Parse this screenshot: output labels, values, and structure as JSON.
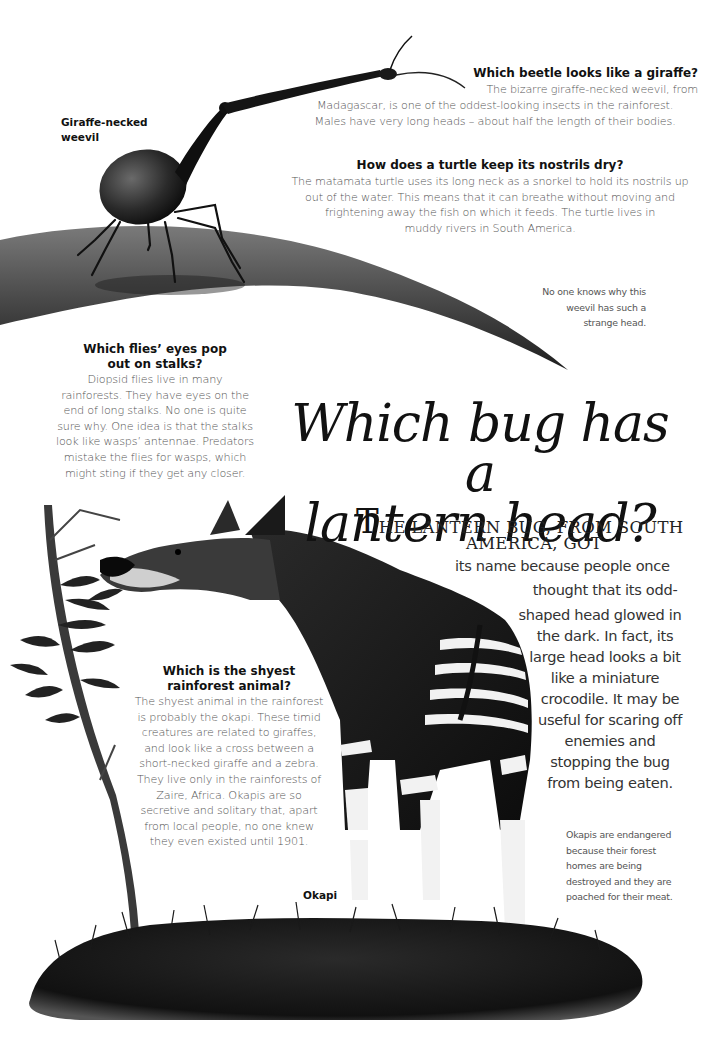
{
  "headline": {
    "line1": "Which bug has a",
    "line2": "lantern head?"
  },
  "lead": {
    "drop_cap": "T",
    "caps_line1": "HE LANTERN BUG, FROM SOUTH",
    "caps_line2": "AMERICA, GOT",
    "body_lines": [
      "its name because people once",
      "thought that its odd-",
      "shaped head glowed in",
      "the dark. In fact, its",
      "large head looks a bit",
      "like a miniature",
      "crocodile. It may be",
      "useful for scaring off",
      "enemies and",
      "stopping the bug",
      "from being eaten."
    ]
  },
  "sections": {
    "beetle": {
      "title": "Which beetle looks like a giraffe?",
      "lines": [
        "The bizarre giraffe-necked weevil, from",
        "Madagascar, is one of the oddest-looking insects in the rainforest.",
        "Males have very long heads – about half the length of their bodies."
      ]
    },
    "turtle": {
      "title": "How does a turtle keep its nostrils dry?",
      "lines": [
        "The matamata turtle uses its long neck as a snorkel to hold its nostrils up",
        "out of the water. This means that it can breathe without moving and",
        "frightening away the fish on which it feeds. The turtle lives in",
        "muddy rivers in South America."
      ]
    },
    "flies": {
      "title_lines": [
        "Which flies’ eyes pop",
        "out on stalks?"
      ],
      "lines": [
        "Diopsid flies live in many",
        "rainforests. They have eyes on the",
        "end of long stalks. No one is quite",
        "sure why. One idea is that the stalks",
        "look like wasps’ antennae. Predators",
        "mistake the flies for wasps, which",
        "might sting if they get any closer."
      ]
    },
    "shyest": {
      "title_lines": [
        "Which is the shyest",
        "rainforest animal?"
      ],
      "lines": [
        "The shyest animal in the rainforest",
        "is probably the okapi. These timid",
        "creatures are related to giraffes,",
        "and look like a cross between a",
        "short-necked giraffe and a zebra.",
        "They live only in the rainforests of",
        "Zaire, Africa. Okapis are so",
        "secretive and solitary that, apart",
        "from local people, no one knew",
        "they even existed until 1901."
      ]
    }
  },
  "captions": {
    "weevil_note": [
      "No one knows why this",
      "weevil has such a",
      "strange head."
    ],
    "okapi_note": [
      "Okapis are endangered",
      "because their forest",
      "homes are being",
      "destroyed and they are",
      "poached for their meat."
    ]
  },
  "labels": {
    "weevil": [
      "Giraffe-necked",
      "weevil"
    ],
    "okapi": "Okapi"
  },
  "illustrations": {
    "weevil": "giraffe-necked-weevil-illustration",
    "leaf": "leaf-illustration",
    "okapi": "okapi-illustration",
    "tree": "sapling-illustration",
    "grass": "grass-illustration"
  }
}
